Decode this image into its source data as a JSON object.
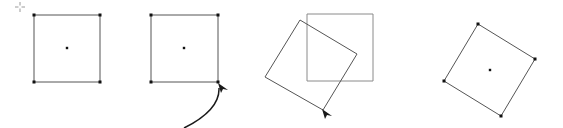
{
  "diagram": {
    "colors": {
      "background": "#ffffff",
      "outline": "#555555",
      "ghost_outline": "#8a8a8a",
      "handle": "#111111",
      "crosshair": "#9a9a9a",
      "arrow": "#1a1a1a"
    },
    "panels": [
      {
        "id": "panel-1-selected",
        "crosshair": [
          20,
          7
        ],
        "square": [
          [
            34,
            15
          ],
          [
            100,
            15
          ],
          [
            100,
            82
          ],
          [
            34,
            82
          ]
        ],
        "center": [
          67,
          48
        ]
      },
      {
        "id": "panel-2-grab-corner",
        "square": [
          [
            151,
            15
          ],
          [
            218,
            15
          ],
          [
            218,
            82
          ],
          [
            151,
            82
          ]
        ],
        "center": [
          184,
          48
        ],
        "arrow_path": "M 184 128 Q 220 110 219 88",
        "cursor": [
          218,
          83
        ]
      },
      {
        "id": "panel-3-rotating",
        "ghost_square": [
          [
            307,
            14
          ],
          [
            373,
            14
          ],
          [
            373,
            81
          ],
          [
            307,
            81
          ]
        ],
        "rotated_square": [
          [
            300,
            20
          ],
          [
            357,
            54
          ],
          [
            323,
            110
          ],
          [
            265,
            77
          ]
        ],
        "cursor": [
          322,
          109
        ]
      },
      {
        "id": "panel-4-rotated",
        "square": [
          [
            478,
            24
          ],
          [
            535,
            59
          ],
          [
            501,
            116
          ],
          [
            444,
            81
          ]
        ],
        "center": [
          490,
          70
        ]
      }
    ]
  }
}
